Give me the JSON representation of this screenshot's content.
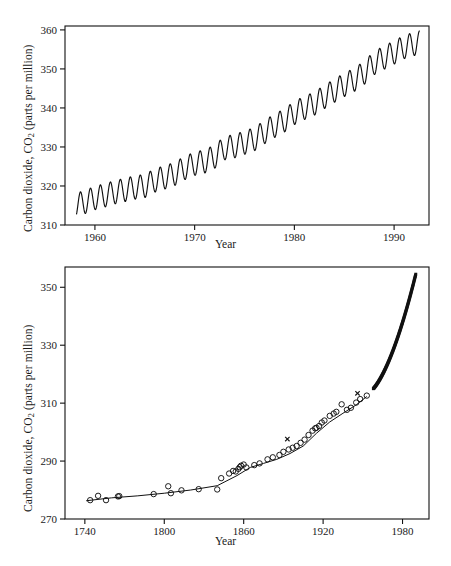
{
  "figure": {
    "background": "#ffffff",
    "ink_color": "#111111"
  },
  "chart_data": [
    {
      "id": "mauna-loa-monthly",
      "type": "line",
      "title": "",
      "xlabel": "Year",
      "ylabel_prefix": "Carbon dioxide, CO",
      "ylabel_sub": "2",
      "ylabel_suffix": " (parts per million)",
      "ylabel_full": "Carbon dioxide, CO2 (parts per million)",
      "xlim": [
        1957.0,
        1993.5
      ],
      "ylim": [
        310,
        361
      ],
      "xticks": [
        1960,
        1970,
        1980,
        1990
      ],
      "xtick_labels": [
        "1960",
        "1970",
        "1980",
        "1990"
      ],
      "yticks": [
        310,
        320,
        330,
        340,
        350,
        360
      ],
      "ytick_labels": [
        "310",
        "320",
        "330",
        "340",
        "350",
        "360"
      ],
      "grid": false,
      "legend": "none",
      "description": "Monthly atmospheric CO2 at Mauna Loa showing a rising trend with an annual sawtooth seasonal cycle of roughly 6 ppm peak-to-trough.",
      "series": [
        {
          "name": "Monthly mean CO2",
          "style": "solid-line",
          "seasonal_amplitude": 3.0,
          "x": [
            1958.0,
            1959.0,
            1960.0,
            1961.0,
            1962.0,
            1963.0,
            1964.0,
            1965.0,
            1966.0,
            1967.0,
            1968.0,
            1969.0,
            1970.0,
            1971.0,
            1972.0,
            1973.0,
            1974.0,
            1975.0,
            1976.0,
            1977.0,
            1978.0,
            1979.0,
            1980.0,
            1981.0,
            1982.0,
            1983.0,
            1984.0,
            1985.0,
            1986.0,
            1987.0,
            1988.0,
            1989.0,
            1990.0,
            1991.0,
            1992.0,
            1993.0
          ],
          "annual_mean": [
            315.0,
            315.9,
            316.9,
            317.6,
            318.4,
            319.0,
            319.6,
            320.0,
            321.4,
            322.2,
            323.1,
            324.6,
            325.7,
            326.3,
            327.5,
            329.7,
            330.2,
            331.1,
            332.0,
            333.8,
            335.4,
            336.8,
            338.7,
            340.0,
            341.1,
            342.8,
            344.4,
            345.9,
            347.2,
            349.0,
            351.5,
            352.9,
            354.2,
            355.6,
            356.4,
            357.1
          ]
        }
      ]
    },
    {
      "id": "ice-core-plus-mauna-loa",
      "type": "scatter",
      "title": "",
      "xlabel": "Year",
      "ylabel_prefix": "Carbon dioxide, CO",
      "ylabel_sub": "2",
      "ylabel_suffix": " (parts per million)",
      "ylabel_full": "Carbon dioxide, CO2 (parts per million)",
      "xlim": [
        1725,
        2000
      ],
      "ylim": [
        270,
        357
      ],
      "xticks": [
        1740,
        1800,
        1860,
        1920,
        1980
      ],
      "xtick_labels": [
        "1740",
        "1800",
        "1860",
        "1920",
        "1980"
      ],
      "yticks": [
        270,
        290,
        310,
        330,
        350
      ],
      "ytick_labels": [
        "270",
        "290",
        "310",
        "330",
        "350"
      ],
      "grid": false,
      "legend": "none",
      "description": "Ice-core CO2 measurements (open circles) from about 1744 to 1953 joined by a fitted smooth curve, merging into dense filled-square direct atmospheric measurements (Mauna Loa) from about 1958 to 1990.",
      "series": [
        {
          "name": "Ice core air bubbles",
          "marker": "open-circle",
          "points": [
            [
              1744,
              276.5
            ],
            [
              1750,
              278.0
            ],
            [
              1756,
              276.5
            ],
            [
              1765,
              277.8
            ],
            [
              1766,
              277.9
            ],
            [
              1792,
              278.6
            ],
            [
              1803,
              281.3
            ],
            [
              1805,
              278.9
            ],
            [
              1813,
              279.9
            ],
            [
              1826,
              280.3
            ],
            [
              1840,
              280.2
            ],
            [
              1843,
              284.1
            ],
            [
              1849,
              285.7
            ],
            [
              1852,
              286.6
            ],
            [
              1854,
              286.4
            ],
            [
              1856,
              287.3
            ],
            [
              1857,
              287.9
            ],
            [
              1858,
              288.4
            ],
            [
              1860,
              288.8
            ],
            [
              1862,
              287.8
            ],
            [
              1868,
              288.6
            ],
            [
              1872,
              289.2
            ],
            [
              1878,
              290.6
            ],
            [
              1882,
              291.3
            ],
            [
              1887,
              292.1
            ],
            [
              1890,
              293.2
            ],
            [
              1894,
              294.0
            ],
            [
              1897,
              294.6
            ],
            [
              1900,
              295.2
            ],
            [
              1903,
              296.3
            ],
            [
              1906,
              297.4
            ],
            [
              1909,
              299.0
            ],
            [
              1912,
              300.5
            ],
            [
              1914,
              301.3
            ],
            [
              1915,
              301.5
            ],
            [
              1917,
              302.1
            ],
            [
              1919,
              303.3
            ],
            [
              1921,
              304.0
            ],
            [
              1925,
              305.6
            ],
            [
              1928,
              306.4
            ],
            [
              1930,
              307.0
            ],
            [
              1934,
              309.6
            ],
            [
              1938,
              307.7
            ],
            [
              1941,
              308.4
            ],
            [
              1945,
              310.2
            ],
            [
              1948,
              311.4
            ],
            [
              1953,
              312.6
            ]
          ]
        },
        {
          "name": "Smooth fit through ice-core data",
          "style": "solid-line"
        },
        {
          "name": "Direct atmospheric measurements",
          "marker": "filled-square",
          "x_start": 1958,
          "x_end": 1990,
          "y_start": 315.0,
          "y_end": 354.5
        },
        {
          "name": "Outlier samples",
          "marker": "x-cross",
          "points": [
            [
              1893,
              297.6
            ],
            [
              1946,
              313.4
            ]
          ]
        }
      ]
    }
  ]
}
